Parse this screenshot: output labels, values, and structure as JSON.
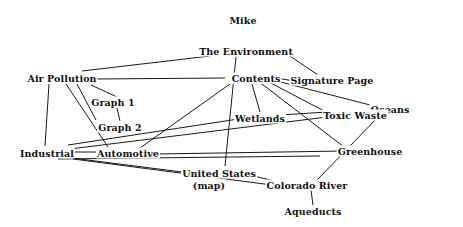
{
  "diagram": {
    "type": "concept-map",
    "colors": {
      "background": "#ffffff",
      "text": "#111111",
      "edge": "#1a1a1a"
    },
    "nodes": [
      {
        "id": "mike",
        "label": "Mike",
        "x": 243,
        "y": 20
      },
      {
        "id": "environment",
        "label": "The Environment",
        "x": 246,
        "y": 51
      },
      {
        "id": "air_pollution",
        "label": "Air Pollution",
        "x": 62,
        "y": 78
      },
      {
        "id": "contents",
        "label": "Contents",
        "x": 256,
        "y": 78
      },
      {
        "id": "signature_page",
        "label": "Signature Page",
        "x": 332,
        "y": 80
      },
      {
        "id": "graph1",
        "label": "Graph 1",
        "x": 113,
        "y": 102
      },
      {
        "id": "oceans",
        "label": "Oceans",
        "x": 390,
        "y": 109
      },
      {
        "id": "toxic_waste",
        "label": "Toxic Waste",
        "x": 355,
        "y": 115
      },
      {
        "id": "wetlands",
        "label": "Wetlands",
        "x": 260,
        "y": 118
      },
      {
        "id": "graph2",
        "label": "Graph 2",
        "x": 120,
        "y": 127
      },
      {
        "id": "industrial",
        "label": "Industrial",
        "x": 47,
        "y": 153
      },
      {
        "id": "automotive",
        "label": "Automotive",
        "x": 128,
        "y": 153
      },
      {
        "id": "greenhouse",
        "label": "Greenhouse",
        "x": 370,
        "y": 151
      },
      {
        "id": "united_states",
        "label": "United States",
        "x": 219,
        "y": 173
      },
      {
        "id": "map",
        "label": "(map)",
        "x": 209,
        "y": 185
      },
      {
        "id": "colorado_river",
        "label": "Colorado River",
        "x": 307,
        "y": 185
      },
      {
        "id": "aqueducts",
        "label": "Aqueducts",
        "x": 313,
        "y": 211
      }
    ],
    "edges": [
      {
        "from": "air_pollution",
        "to": "environment",
        "x1": 82,
        "y1": 71,
        "x2": 210,
        "y2": 56
      },
      {
        "from": "environment",
        "to": "signature_page",
        "x1": 287,
        "y1": 54,
        "x2": 318,
        "y2": 75
      },
      {
        "from": "environment",
        "to": "united_states",
        "x1": 236,
        "y1": 57,
        "x2": 225,
        "y2": 166
      },
      {
        "from": "air_pollution",
        "to": "contents",
        "x1": 95,
        "y1": 79,
        "x2": 225,
        "y2": 78
      },
      {
        "from": "contents",
        "to": "signature_page",
        "x1": 265,
        "y1": 76,
        "x2": 300,
        "y2": 82
      },
      {
        "from": "contents",
        "to": "oceans",
        "x1": 265,
        "y1": 78,
        "x2": 374,
        "y2": 106
      },
      {
        "from": "contents",
        "to": "toxic_waste",
        "x1": 265,
        "y1": 80,
        "x2": 328,
        "y2": 113
      },
      {
        "from": "contents",
        "to": "wetlands",
        "x1": 252,
        "y1": 84,
        "x2": 260,
        "y2": 112
      },
      {
        "from": "contents",
        "to": "greenhouse",
        "x1": 262,
        "y1": 84,
        "x2": 344,
        "y2": 147
      },
      {
        "from": "contents",
        "to": "automotive",
        "x1": 230,
        "y1": 84,
        "x2": 140,
        "y2": 148
      },
      {
        "from": "air_pollution",
        "to": "graph1",
        "x1": 91,
        "y1": 85,
        "x2": 117,
        "y2": 97
      },
      {
        "from": "graph1",
        "to": "graph2",
        "x1": 117,
        "y1": 108,
        "x2": 120,
        "y2": 121
      },
      {
        "from": "air_pollution",
        "to": "industrial",
        "x1": 49,
        "y1": 84,
        "x2": 45,
        "y2": 146
      },
      {
        "from": "air_pollution",
        "to": "automotive",
        "x1": 66,
        "y1": 84,
        "x2": 108,
        "y2": 147
      },
      {
        "from": "air_pollution",
        "to": "automotive",
        "x1": 77,
        "y1": 84,
        "x2": 96,
        "y2": 120
      },
      {
        "from": "industrial",
        "to": "wetlands",
        "x1": 68,
        "y1": 145,
        "x2": 245,
        "y2": 118
      },
      {
        "from": "industrial",
        "to": "toxic_waste",
        "x1": 70,
        "y1": 149,
        "x2": 327,
        "y2": 117
      },
      {
        "from": "wetlands",
        "to": "toxic_waste",
        "x1": 280,
        "y1": 115,
        "x2": 327,
        "y2": 112
      },
      {
        "from": "industrial",
        "to": "automotive",
        "x1": 71,
        "y1": 152,
        "x2": 103,
        "y2": 152
      },
      {
        "from": "automotive",
        "to": "greenhouse",
        "x1": 156,
        "y1": 154,
        "x2": 343,
        "y2": 151
      },
      {
        "from": "industrial",
        "to": "greenhouse",
        "x1": 58,
        "y1": 159,
        "x2": 320,
        "y2": 156
      },
      {
        "from": "industrial",
        "to": "united_states",
        "x1": 72,
        "y1": 158,
        "x2": 190,
        "y2": 173
      },
      {
        "from": "industrial",
        "to": "colorado_river",
        "x1": 73,
        "y1": 159,
        "x2": 272,
        "y2": 185
      },
      {
        "from": "united_states",
        "to": "colorado_river",
        "x1": 245,
        "y1": 174,
        "x2": 275,
        "y2": 181
      },
      {
        "from": "oceans",
        "to": "colorado_river",
        "x1": 380,
        "y1": 115,
        "x2": 317,
        "y2": 180
      },
      {
        "from": "colorado_river",
        "to": "aqueducts",
        "x1": 311,
        "y1": 190,
        "x2": 313,
        "y2": 205
      }
    ]
  }
}
